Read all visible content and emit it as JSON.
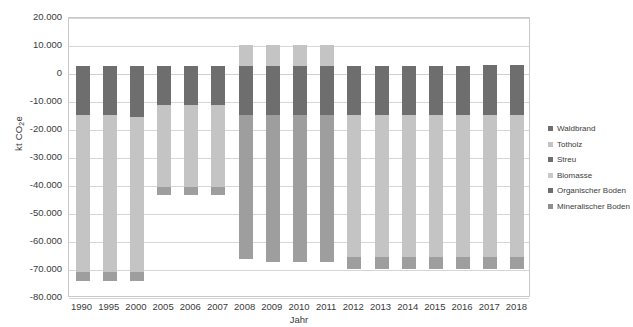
{
  "chart_data": {
    "type": "bar",
    "subtype": "stacked-bar",
    "title": "",
    "xlabel": "Jahr",
    "ylabel": "kt CO2e",
    "ylabel_parts": {
      "pre": "kt CO",
      "sub": "2",
      "post": "e"
    },
    "ylim": [
      -80000,
      20000
    ],
    "ytick_step": 10000,
    "ytick_labels": [
      "20.000",
      "10.000",
      "0",
      "-10.000",
      "-20.000",
      "-30.000",
      "-40.000",
      "-50.000",
      "-60.000",
      "-70.000",
      "-80.000"
    ],
    "ytick_values": [
      20000,
      10000,
      0,
      -10000,
      -20000,
      -30000,
      -40000,
      -50000,
      -60000,
      -70000,
      -80000
    ],
    "grid": true,
    "legend_position": "right",
    "categories": [
      "1990",
      "1995",
      "2000",
      "2005",
      "2006",
      "2007",
      "2008",
      "2009",
      "2010",
      "2011",
      "2012",
      "2013",
      "2014",
      "2015",
      "2016",
      "2017",
      "2018"
    ],
    "series": [
      {
        "name": "Waldbrand",
        "color": "#6e6e6e",
        "values": [
          0,
          0,
          0,
          0,
          0,
          0,
          0,
          0,
          0,
          0,
          0,
          0,
          0,
          0,
          0,
          0,
          0
        ]
      },
      {
        "name": "Totholz",
        "color": "#c4c4c4",
        "values": [
          0,
          0,
          0,
          0,
          0,
          0,
          0,
          0,
          0,
          0,
          0,
          0,
          0,
          0,
          0,
          0,
          0
        ]
      },
      {
        "name": "Streu",
        "color": "#6e6e6e",
        "values": [
          3000,
          3000,
          3000,
          2700,
          2700,
          2700,
          3000,
          3000,
          3000,
          3000,
          3000,
          3000,
          3000,
          3000,
          3000,
          3300,
          3300
        ]
      },
      {
        "name": "Biomasse",
        "color": "#c4c4c4",
        "values": [
          -14800,
          -14800,
          -14800,
          -11200,
          -11200,
          -11200,
          10000,
          10000,
          10000,
          10000,
          -14800,
          -14800,
          -14800,
          -14800,
          -14800,
          -15400,
          -15400
        ]
      },
      {
        "name": "Organischer Boden",
        "color": "#6e6e6e",
        "values": [
          -58500,
          -58500,
          -58500,
          -30000,
          -30000,
          -30000,
          -22000,
          -22000,
          -22000,
          -22000,
          -51000,
          -51000,
          -51000,
          -51000,
          -51000,
          -50500,
          -50500
        ]
      },
      {
        "name": "Mineralischer Boden",
        "color": "#9e9e9e",
        "values": [
          -3000,
          -3000,
          -3000,
          -2500,
          -2500,
          -2500,
          -44000,
          -44000,
          -44000,
          -44000,
          -3200,
          -3200,
          -3200,
          -3200,
          -3200,
          -3200,
          -3200
        ]
      }
    ],
    "stack_totals": {
      "1990": -73300,
      "1995": -73300,
      "2000": -73300,
      "2005": -41000,
      "2006": -41000,
      "2007": -41000,
      "2008": -53000,
      "2009": -53000,
      "2010": -53000,
      "2011": -53000,
      "2012": -66000,
      "2013": -66000,
      "2014": -66000,
      "2015": -66000,
      "2016": -66000,
      "2017": -65800,
      "2018": -65800
    },
    "bars": [
      {
        "year": "1990",
        "top": 3000,
        "segments": [
          {
            "series": "Streu",
            "from": 3000,
            "to": -14800
          },
          {
            "series": "Biomasse",
            "from": -14800,
            "to": -70800
          },
          {
            "series": "Mineralischer Boden",
            "from": -70800,
            "to": -73800
          }
        ]
      },
      {
        "year": "1995",
        "top": 3000,
        "segments": [
          {
            "series": "Streu",
            "from": 3000,
            "to": -14800
          },
          {
            "series": "Biomasse",
            "from": -14800,
            "to": -70800
          },
          {
            "series": "Mineralischer Boden",
            "from": -70800,
            "to": -73800
          }
        ]
      },
      {
        "year": "2000",
        "top": 3000,
        "segments": [
          {
            "series": "Streu",
            "from": 3000,
            "to": -15200
          },
          {
            "series": "Biomasse",
            "from": -15200,
            "to": -70800
          },
          {
            "series": "Mineralischer Boden",
            "from": -70800,
            "to": -73800
          }
        ]
      },
      {
        "year": "2005",
        "top": 2700,
        "segments": [
          {
            "series": "Streu",
            "from": 2700,
            "to": -11200
          },
          {
            "series": "Biomasse",
            "from": -11200,
            "to": -40200
          },
          {
            "series": "Mineralischer Boden",
            "from": -40200,
            "to": -43200
          }
        ]
      },
      {
        "year": "2006",
        "top": 2700,
        "segments": [
          {
            "series": "Streu",
            "from": 2700,
            "to": -11200
          },
          {
            "series": "Biomasse",
            "from": -11200,
            "to": -40200
          },
          {
            "series": "Mineralischer Boden",
            "from": -40200,
            "to": -43200
          }
        ]
      },
      {
        "year": "2007",
        "top": 2700,
        "segments": [
          {
            "series": "Streu",
            "from": 2700,
            "to": -11200
          },
          {
            "series": "Biomasse",
            "from": -11200,
            "to": -40200
          },
          {
            "series": "Mineralischer Boden",
            "from": -40200,
            "to": -43200
          }
        ]
      },
      {
        "year": "2008",
        "top": 10200,
        "segments": [
          {
            "series": "Biomasse",
            "from": 10200,
            "to": 3000
          },
          {
            "series": "Streu",
            "from": 3000,
            "to": -14800
          },
          {
            "series": "Mineralischer Boden",
            "from": -14800,
            "to": -66000
          }
        ]
      },
      {
        "year": "2009",
        "top": 10200,
        "segments": [
          {
            "series": "Biomasse",
            "from": 10200,
            "to": 3000
          },
          {
            "series": "Streu",
            "from": 3000,
            "to": -14800
          },
          {
            "series": "Mineralischer Boden",
            "from": -14800,
            "to": -67000
          }
        ]
      },
      {
        "year": "2010",
        "top": 10200,
        "segments": [
          {
            "series": "Biomasse",
            "from": 10200,
            "to": 3000
          },
          {
            "series": "Streu",
            "from": 3000,
            "to": -14800
          },
          {
            "series": "Mineralischer Boden",
            "from": -14800,
            "to": -67000
          }
        ]
      },
      {
        "year": "2011",
        "top": 10200,
        "segments": [
          {
            "series": "Biomasse",
            "from": 10200,
            "to": 3000
          },
          {
            "series": "Streu",
            "from": 3000,
            "to": -14800
          },
          {
            "series": "Mineralischer Boden",
            "from": -14800,
            "to": -67000
          }
        ]
      },
      {
        "year": "2012",
        "top": 3000,
        "segments": [
          {
            "series": "Streu",
            "from": 3000,
            "to": -14800
          },
          {
            "series": "Biomasse",
            "from": -14800,
            "to": -65500
          },
          {
            "series": "Mineralischer Boden",
            "from": -65500,
            "to": -69500
          }
        ]
      },
      {
        "year": "2013",
        "top": 3000,
        "segments": [
          {
            "series": "Streu",
            "from": 3000,
            "to": -14800
          },
          {
            "series": "Biomasse",
            "from": -14800,
            "to": -65500
          },
          {
            "series": "Mineralischer Boden",
            "from": -65500,
            "to": -69500
          }
        ]
      },
      {
        "year": "2014",
        "top": 3000,
        "segments": [
          {
            "series": "Streu",
            "from": 3000,
            "to": -14800
          },
          {
            "series": "Biomasse",
            "from": -14800,
            "to": -65500
          },
          {
            "series": "Mineralischer Boden",
            "from": -65500,
            "to": -69500
          }
        ]
      },
      {
        "year": "2015",
        "top": 3000,
        "segments": [
          {
            "series": "Streu",
            "from": 3000,
            "to": -14800
          },
          {
            "series": "Biomasse",
            "from": -14800,
            "to": -65500
          },
          {
            "series": "Mineralischer Boden",
            "from": -65500,
            "to": -69500
          }
        ]
      },
      {
        "year": "2016",
        "top": 3000,
        "segments": [
          {
            "series": "Streu",
            "from": 3000,
            "to": -14800
          },
          {
            "series": "Biomasse",
            "from": -14800,
            "to": -65500
          },
          {
            "series": "Mineralischer Boden",
            "from": -65500,
            "to": -69500
          }
        ]
      },
      {
        "year": "2017",
        "top": 3300,
        "segments": [
          {
            "series": "Streu",
            "from": 3300,
            "to": -14800
          },
          {
            "series": "Biomasse",
            "from": -14800,
            "to": -65500
          },
          {
            "series": "Mineralischer Boden",
            "from": -65500,
            "to": -69500
          }
        ]
      },
      {
        "year": "2018",
        "top": 3300,
        "segments": [
          {
            "series": "Streu",
            "from": 3300,
            "to": -14800
          },
          {
            "series": "Biomasse",
            "from": -14800,
            "to": -65500
          },
          {
            "series": "Mineralischer Boden",
            "from": -65500,
            "to": -69500
          }
        ]
      }
    ]
  },
  "legend": {
    "items": [
      {
        "label": "Waldbrand",
        "color": "#6e6e6e"
      },
      {
        "label": "Totholz",
        "color": "#c4c4c4"
      },
      {
        "label": "Streu",
        "color": "#6e6e6e"
      },
      {
        "label": "Biomasse",
        "color": "#c9c9c9"
      },
      {
        "label": "Organischer Boden",
        "color": "#6e6e6e"
      },
      {
        "label": "Mineralischer Boden",
        "color": "#8f8f8f"
      }
    ]
  },
  "colors": {
    "dark_gray": "#6e6e6e",
    "mid_gray": "#9e9e9e",
    "light_gray": "#c4c4c4",
    "gridline": "#d6d6d6",
    "frame": "#c9c9c9",
    "text": "#3a3a3a"
  }
}
